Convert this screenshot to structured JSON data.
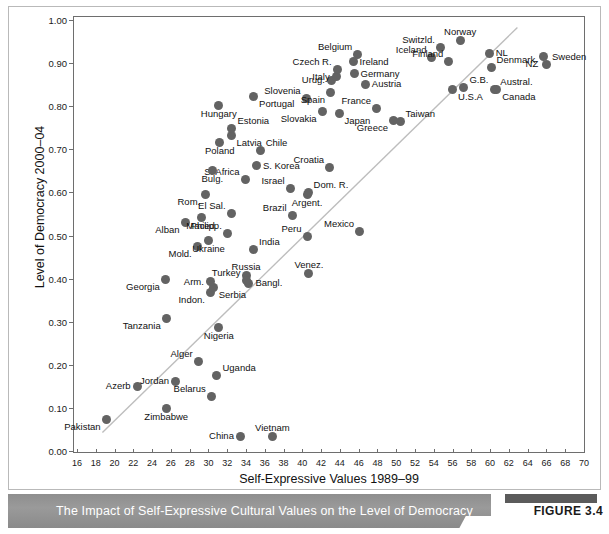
{
  "figure": {
    "caption": "The Impact of Self-Expressive Cultural Values on the Level of Democracy",
    "badge_label": "FIGURE 3.4",
    "dot_color": "#636363",
    "axis_color": "#6e6e6e",
    "trend_color": "#bdbdbd",
    "caption_bar_color": "#909090"
  },
  "chart_data": {
    "type": "scatter",
    "title": "",
    "xlabel": "Self-Expressive Values 1989–99",
    "ylabel": "Level of Democracy 2000–04",
    "xlim": [
      16,
      70
    ],
    "ylim": [
      0.0,
      1.0
    ],
    "xticks": [
      16,
      18,
      20,
      22,
      24,
      26,
      28,
      30,
      32,
      34,
      36,
      38,
      40,
      42,
      44,
      46,
      48,
      50,
      52,
      54,
      56,
      58,
      60,
      62,
      64,
      66,
      68,
      70
    ],
    "yticks": [
      "0.00",
      "0.10",
      "0.20",
      "0.30",
      "0.40",
      "0.50",
      "0.60",
      "0.70",
      "0.80",
      "0.90",
      "1.00"
    ],
    "ytick_values": [
      0.0,
      0.1,
      0.2,
      0.3,
      0.4,
      0.5,
      0.6,
      0.7,
      0.8,
      0.9,
      1.0
    ],
    "grid": false,
    "legend": "none",
    "trendline": {
      "x0": 18.6,
      "y0": 0.045,
      "x1": 62.8,
      "y1": 0.985
    },
    "points": [
      {
        "label": "Pakistan",
        "x": 19.0,
        "y": 0.076,
        "lp": "bl"
      },
      {
        "label": "Azerb",
        "x": 22.3,
        "y": 0.152,
        "lp": "l"
      },
      {
        "label": "Zimbabwe",
        "x": 25.4,
        "y": 0.101,
        "lp": "b"
      },
      {
        "label": "Tanzania",
        "x": 25.4,
        "y": 0.31,
        "lp": "bl"
      },
      {
        "label": "Georgia",
        "x": 25.3,
        "y": 0.401,
        "lp": "bl"
      },
      {
        "label": "Jordan",
        "x": 26.4,
        "y": 0.164,
        "lp": "l"
      },
      {
        "label": "Alger",
        "x": 28.8,
        "y": 0.211,
        "lp": "tl"
      },
      {
        "label": "Belarus",
        "x": 30.2,
        "y": 0.129,
        "lp": "tl"
      },
      {
        "label": "Uganda",
        "x": 30.8,
        "y": 0.178,
        "lp": "tr"
      },
      {
        "label": "Nigeria",
        "x": 31.0,
        "y": 0.29,
        "lp": "b"
      },
      {
        "label": "China",
        "x": 33.3,
        "y": 0.037,
        "lp": "l"
      },
      {
        "label": "Vietnam",
        "x": 36.7,
        "y": 0.037,
        "lp": "t"
      },
      {
        "label": "Indon.",
        "x": 30.1,
        "y": 0.37,
        "lp": "bl"
      },
      {
        "label": "Serbia",
        "x": 30.4,
        "y": 0.382,
        "lp": "br"
      },
      {
        "label": "Arm.",
        "x": 30.1,
        "y": 0.395,
        "lp": "l"
      },
      {
        "label": "Russia",
        "x": 33.9,
        "y": 0.41,
        "lp": "t"
      },
      {
        "label": "Bangl.",
        "x": 34.2,
        "y": 0.392,
        "lp": "r"
      },
      {
        "label": "Venez.",
        "x": 40.6,
        "y": 0.415,
        "lp": "t"
      },
      {
        "label": "Turkey",
        "x": 33.9,
        "y": 0.398,
        "lp": "tl"
      },
      {
        "label": "Mold.",
        "x": 28.7,
        "y": 0.476,
        "lp": "bl"
      },
      {
        "label": "Ukraine",
        "x": 29.9,
        "y": 0.491,
        "lp": "b"
      },
      {
        "label": "India",
        "x": 34.7,
        "y": 0.47,
        "lp": "tr"
      },
      {
        "label": "Peru",
        "x": 40.4,
        "y": 0.501,
        "lp": "tl"
      },
      {
        "label": "Mexico",
        "x": 46.0,
        "y": 0.511,
        "lp": "tl"
      },
      {
        "label": "Alban",
        "x": 27.4,
        "y": 0.533,
        "lp": "bl"
      },
      {
        "label": "Maced.",
        "x": 29.2,
        "y": 0.543,
        "lp": "b"
      },
      {
        "label": "Philipp.",
        "x": 31.9,
        "y": 0.508,
        "lp": "tl"
      },
      {
        "label": "Brazil",
        "x": 38.8,
        "y": 0.548,
        "lp": "tl"
      },
      {
        "label": "Rom.",
        "x": 29.6,
        "y": 0.598,
        "lp": "bl"
      },
      {
        "label": "El Sal.",
        "x": 32.3,
        "y": 0.554,
        "lp": "tl"
      },
      {
        "label": "Argent.",
        "x": 40.4,
        "y": 0.598,
        "lp": "b"
      },
      {
        "label": "S. Africa",
        "x": 33.8,
        "y": 0.633,
        "lp": "tl"
      },
      {
        "label": "Israel",
        "x": 38.6,
        "y": 0.612,
        "lp": "tl"
      },
      {
        "label": "Dom. R.",
        "x": 40.5,
        "y": 0.603,
        "lp": "tr"
      },
      {
        "label": "Bulg.",
        "x": 30.3,
        "y": 0.652,
        "lp": "b"
      },
      {
        "label": "S. Korea",
        "x": 35.0,
        "y": 0.664,
        "lp": "r"
      },
      {
        "label": "Croatia",
        "x": 42.8,
        "y": 0.661,
        "lp": "tl"
      },
      {
        "label": "Poland",
        "x": 31.1,
        "y": 0.719,
        "lp": "b"
      },
      {
        "label": "Chile",
        "x": 35.4,
        "y": 0.699,
        "lp": "tr"
      },
      {
        "label": "Latvia",
        "x": 32.3,
        "y": 0.735,
        "lp": "br"
      },
      {
        "label": "Estonia",
        "x": 32.4,
        "y": 0.75,
        "lp": "tr"
      },
      {
        "label": "Hungary",
        "x": 31.0,
        "y": 0.805,
        "lp": "b"
      },
      {
        "label": "Portugal",
        "x": 34.7,
        "y": 0.824,
        "lp": "br"
      },
      {
        "label": "Slovenia",
        "x": 40.3,
        "y": 0.821,
        "lp": "tl"
      },
      {
        "label": "Slovakia",
        "x": 42.0,
        "y": 0.79,
        "lp": "bl"
      },
      {
        "label": "Spain",
        "x": 42.9,
        "y": 0.835,
        "lp": "bl"
      },
      {
        "label": "Japan",
        "x": 43.8,
        "y": 0.786,
        "lp": "br"
      },
      {
        "label": "Urug.",
        "x": 43.0,
        "y": 0.862,
        "lp": "l"
      },
      {
        "label": "Italy",
        "x": 43.5,
        "y": 0.871,
        "lp": "l"
      },
      {
        "label": "Czech R.",
        "x": 43.6,
        "y": 0.888,
        "lp": "tl"
      },
      {
        "label": "Belgium",
        "x": 45.8,
        "y": 0.922,
        "lp": "tl"
      },
      {
        "label": "Ireland",
        "x": 45.3,
        "y": 0.906,
        "lp": "r"
      },
      {
        "label": "Germany",
        "x": 45.4,
        "y": 0.878,
        "lp": "r"
      },
      {
        "label": "Austria",
        "x": 46.6,
        "y": 0.853,
        "lp": "r"
      },
      {
        "label": "France",
        "x": 47.8,
        "y": 0.798,
        "lp": "tl"
      },
      {
        "label": "Greece",
        "x": 49.6,
        "y": 0.769,
        "lp": "bl"
      },
      {
        "label": "Taiwan",
        "x": 50.3,
        "y": 0.766,
        "lp": "tr"
      },
      {
        "label": "Iceland",
        "x": 53.7,
        "y": 0.916,
        "lp": "tl"
      },
      {
        "label": "Switzld.",
        "x": 54.6,
        "y": 0.938,
        "lp": "tl"
      },
      {
        "label": "Finland",
        "x": 55.5,
        "y": 0.906,
        "lp": "tl"
      },
      {
        "label": "Norway",
        "x": 56.7,
        "y": 0.954,
        "lp": "t"
      },
      {
        "label": "U.S.A",
        "x": 55.9,
        "y": 0.84,
        "lp": "br"
      },
      {
        "label": "G.B.",
        "x": 57.1,
        "y": 0.845,
        "lp": "tr"
      },
      {
        "label": "NL",
        "x": 59.8,
        "y": 0.925,
        "lp": "r"
      },
      {
        "label": "Denmark",
        "x": 60.0,
        "y": 0.893,
        "lp": "tr"
      },
      {
        "label": "Austral.",
        "x": 60.4,
        "y": 0.841,
        "lp": "tr"
      },
      {
        "label": "Canada",
        "x": 60.6,
        "y": 0.841,
        "lp": "br"
      },
      {
        "label": "NZ",
        "x": 65.6,
        "y": 0.918,
        "lp": "bl"
      },
      {
        "label": "Sweden",
        "x": 65.9,
        "y": 0.899,
        "lp": "tr"
      }
    ]
  }
}
